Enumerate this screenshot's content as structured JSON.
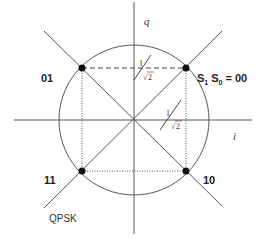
{
  "diagram": {
    "title": "QPSK",
    "axes": {
      "horizontal_label": "i",
      "vertical_label": "q"
    },
    "points": [
      {
        "label": "01",
        "quadrant": "upper-left"
      },
      {
        "label": "S1 S0 = 00",
        "label_main": "S",
        "sub1": "1",
        "sub0": "0",
        "value": "= 00",
        "quadrant": "upper-right"
      },
      {
        "label": "11",
        "quadrant": "lower-left"
      },
      {
        "label": "10",
        "quadrant": "lower-right"
      }
    ],
    "annotations": [
      {
        "numerator": "1",
        "denominator": "2",
        "radical": "√",
        "position": "top-dashed-line"
      },
      {
        "numerator": "1",
        "denominator": "2",
        "radical": "√",
        "position": "near-i-axis"
      }
    ],
    "colors": {
      "line": "#555555",
      "point": "#111111"
    }
  }
}
